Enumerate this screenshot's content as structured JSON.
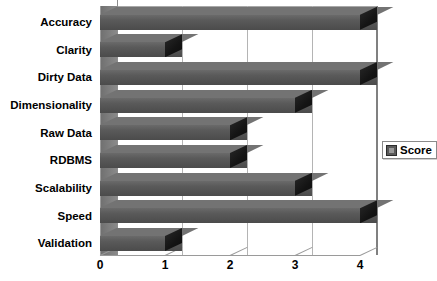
{
  "chart_data": {
    "type": "bar",
    "orientation": "horizontal",
    "title": "",
    "subtitle": "",
    "xlabel": "",
    "ylabel": "",
    "categories": [
      "Accuracy",
      "Clarity",
      "Dirty Data",
      "Dimensionality",
      "Raw Data",
      "RDBMS",
      "Scalability",
      "Speed",
      "Validation"
    ],
    "values": [
      4,
      1,
      4,
      3,
      2,
      2,
      3,
      4,
      1
    ],
    "series": [
      {
        "name": "Score",
        "values": [
          4,
          1,
          4,
          3,
          2,
          2,
          3,
          4,
          1
        ]
      }
    ],
    "xticks": [
      "0",
      "1",
      "2",
      "3",
      "4"
    ],
    "xtick_values": [
      0,
      1,
      2,
      3,
      4
    ],
    "xlim": [
      0,
      4
    ],
    "grid": true,
    "grid_axis": "x",
    "legend": [
      "Score"
    ],
    "legend_position": "right",
    "style": "3d",
    "bar_color": "#5a5a5a",
    "bar_top_color": "#737373",
    "bar_cap_color": "#141414",
    "background_color": "#ffffff",
    "axis_color": "#9a9a9a",
    "grid_color": "#b4b4b4",
    "text_color": "#000000"
  },
  "legend": {
    "label": "Score"
  }
}
